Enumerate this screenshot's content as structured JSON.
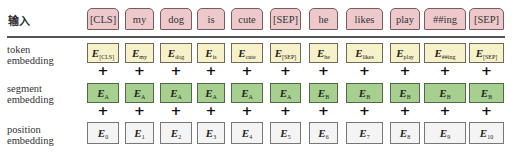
{
  "input_label": "输入",
  "row_labels": {
    "token": [
      "token",
      "embedding"
    ],
    "segment": [
      "segment",
      "embedding"
    ],
    "position": [
      "position",
      "embedding"
    ]
  },
  "colors": {
    "token_input": "#eec9cc",
    "token_embedding": "#f7f1c9",
    "segment_embedding": "#a7cf8f",
    "position_embedding": "#f4f4f4",
    "divider": "#555555"
  },
  "plus_symbol": "+",
  "embedding_symbol": "E",
  "columns": [
    {
      "token": "[CLS]",
      "tok_sub": "[CLS]",
      "seg_sub": "A",
      "pos_sub": "0"
    },
    {
      "token": "my",
      "tok_sub": "my",
      "seg_sub": "A",
      "pos_sub": "1"
    },
    {
      "token": "dog",
      "tok_sub": "dog",
      "seg_sub": "A",
      "pos_sub": "2"
    },
    {
      "token": "is",
      "tok_sub": "is",
      "seg_sub": "A",
      "pos_sub": "3"
    },
    {
      "token": "cute",
      "tok_sub": "cute",
      "seg_sub": "A",
      "pos_sub": "4"
    },
    {
      "token": "[SEP]",
      "tok_sub": "[SEP]",
      "seg_sub": "A",
      "pos_sub": "5"
    },
    {
      "token": "he",
      "tok_sub": "he",
      "seg_sub": "B",
      "pos_sub": "6"
    },
    {
      "token": "likes",
      "tok_sub": "likes",
      "seg_sub": "B",
      "pos_sub": "7"
    },
    {
      "token": "play",
      "tok_sub": "play",
      "seg_sub": "B",
      "pos_sub": "8"
    },
    {
      "token": "##ing",
      "tok_sub": "##ing",
      "seg_sub": "B",
      "pos_sub": "9"
    },
    {
      "token": "[SEP]",
      "tok_sub": "[SEP]",
      "seg_sub": "B",
      "pos_sub": "10"
    }
  ]
}
